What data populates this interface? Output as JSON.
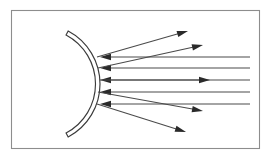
{
  "figure": {
    "caption": "",
    "width": 271,
    "height": 158,
    "background_color": "#ffffff"
  },
  "frame": {
    "name": "figure-border",
    "x": 11.5,
    "y": 10.5,
    "width": 248,
    "height": 138,
    "stroke_color": "#8d8d8d",
    "stroke_width": 1.1
  },
  "mirror": {
    "label": "concave-mirror",
    "type": "spherical-reflector-arc",
    "center_x": 40,
    "center_y": 84,
    "outer_radius": 60,
    "inner_radius": 55.5,
    "start_angle_deg": -62,
    "end_angle_deg": 62,
    "stroke_color": "#3b3b3b",
    "fill_color": "#ffffff",
    "stroke_width": 1.15
  },
  "chart_data": {
    "type": "line",
    "xlabel": "",
    "ylabel": "",
    "grid": false,
    "legend_position": "none",
    "xlim": [
      0,
      271
    ],
    "ylim": [
      0,
      158
    ],
    "annotations": [],
    "series": [
      {
        "name": "incoming-ray-1",
        "role": "incident",
        "direction": "leftward",
        "arrow_at": "start",
        "x": [
          250,
          100
        ],
        "y": [
          57,
          57
        ]
      },
      {
        "name": "incoming-ray-2",
        "role": "incident",
        "direction": "leftward",
        "arrow_at": "start",
        "x": [
          250,
          100
        ],
        "y": [
          68,
          68
        ]
      },
      {
        "name": "incoming-ray-3",
        "role": "incident",
        "direction": "leftward",
        "arrow_at": "start",
        "x": [
          250,
          100
        ],
        "y": [
          80,
          80
        ]
      },
      {
        "name": "incoming-ray-4",
        "role": "incident",
        "direction": "leftward",
        "arrow_at": "start",
        "x": [
          250,
          100
        ],
        "y": [
          92,
          92
        ]
      },
      {
        "name": "incoming-ray-5",
        "role": "incident",
        "direction": "leftward",
        "arrow_at": "start",
        "x": [
          250,
          100
        ],
        "y": [
          104,
          104
        ]
      },
      {
        "name": "reflected-ray-1",
        "role": "reflected",
        "direction": "rightward-up",
        "arrow_at": "end",
        "x": [
          97,
          188
        ],
        "y": [
          57,
          31
        ]
      },
      {
        "name": "reflected-ray-2",
        "role": "reflected",
        "direction": "rightward-up",
        "arrow_at": "end",
        "x": [
          98,
          203
        ],
        "y": [
          68,
          45
        ]
      },
      {
        "name": "reflected-ray-3",
        "role": "reflected",
        "direction": "rightward-axis",
        "arrow_at": "end",
        "x": [
          100,
          210
        ],
        "y": [
          80,
          80
        ]
      },
      {
        "name": "reflected-ray-4",
        "role": "reflected",
        "direction": "rightward-down",
        "arrow_at": "end",
        "x": [
          98,
          203
        ],
        "y": [
          92,
          111
        ]
      },
      {
        "name": "reflected-ray-5",
        "role": "reflected",
        "direction": "rightward-down",
        "arrow_at": "end",
        "x": [
          97,
          186
        ],
        "y": [
          104,
          132
        ]
      }
    ]
  },
  "rays": {
    "incident": [
      {
        "name": "incident-ray-top",
        "x1": 250,
        "y1": 57,
        "x2": 100,
        "y2": 57,
        "head": "start"
      },
      {
        "name": "incident-ray-upper-mid",
        "x1": 250,
        "y1": 68,
        "x2": 100,
        "y2": 68,
        "head": "start"
      },
      {
        "name": "incident-ray-axis",
        "x1": 250,
        "y1": 80,
        "x2": 100,
        "y2": 80,
        "head": "start"
      },
      {
        "name": "incident-ray-lower-mid",
        "x1": 250,
        "y1": 92,
        "x2": 100,
        "y2": 92,
        "head": "start"
      },
      {
        "name": "incident-ray-bottom",
        "x1": 250,
        "y1": 104,
        "x2": 100,
        "y2": 104,
        "head": "start"
      }
    ],
    "reflected": [
      {
        "name": "reflected-ray-top",
        "x1": 97,
        "y1": 57,
        "x2": 188,
        "y2": 31,
        "head": "end"
      },
      {
        "name": "reflected-ray-upper-mid",
        "x1": 98,
        "y1": 68,
        "x2": 203,
        "y2": 45,
        "head": "end"
      },
      {
        "name": "reflected-ray-axis",
        "x1": 100,
        "y1": 80,
        "x2": 210,
        "y2": 80,
        "head": "end"
      },
      {
        "name": "reflected-ray-lower-mid",
        "x1": 98,
        "y1": 92,
        "x2": 203,
        "y2": 111,
        "head": "end"
      },
      {
        "name": "reflected-ray-bottom",
        "x1": 97,
        "y1": 104,
        "x2": 186,
        "y2": 132,
        "head": "end"
      }
    ],
    "stroke_color": "#4a4a4a",
    "arrow_fill": "#2a2a2a",
    "arrow_length": 11,
    "arrow_half_width": 3.2
  }
}
